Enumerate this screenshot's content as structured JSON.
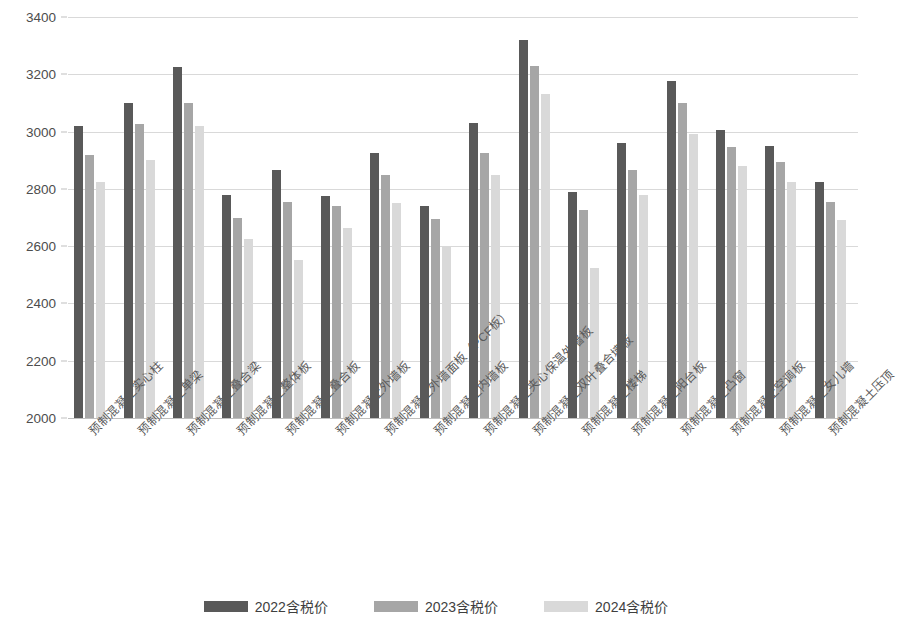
{
  "chart_data": {
    "type": "bar",
    "title": "",
    "subtitle": "",
    "xlabel": "",
    "ylabel": "",
    "ylim": [
      2000,
      3400
    ],
    "ytick_step": 200,
    "yticks": [
      "2000",
      "2200",
      "2400",
      "2600",
      "2800",
      "3000",
      "3200",
      "3400"
    ],
    "grid": true,
    "legend_position": "bottom",
    "categories": [
      "预制混凝土实心柱",
      "预制混凝土单梁",
      "预制混凝土叠合梁",
      "预制混凝土整体板",
      "预制混凝土叠合板",
      "预制混凝土外墙板",
      "预制混凝土外墙面板（PCF板）",
      "预制混凝土内墙板",
      "预制混凝土夹心保温外墙板",
      "预制混凝土双叶叠合墙板",
      "预制混凝土楼梯",
      "预制混凝土阳台板",
      "预制混凝土凸窗",
      "预制混凝土空调板",
      "预制混凝土女儿墙",
      "预制混凝土压顶"
    ],
    "series": [
      {
        "name": "2022含税价",
        "color": "#595959",
        "values": [
          3020,
          3100,
          3225,
          2780,
          2865,
          2775,
          2925,
          2740,
          3030,
          3320,
          2790,
          2960,
          3175,
          3005,
          2950,
          2825
        ]
      },
      {
        "name": "2023含税价",
        "color": "#a6a6a6",
        "values": [
          2920,
          3025,
          3100,
          2700,
          2755,
          2740,
          2850,
          2695,
          2925,
          3230,
          2725,
          2865,
          3100,
          2945,
          2895,
          2755
        ]
      },
      {
        "name": "2024含税价",
        "color": "#d9d9d9",
        "values": [
          2825,
          2900,
          3020,
          2625,
          2550,
          2665,
          2750,
          2600,
          2850,
          3130,
          2525,
          2780,
          2990,
          2880,
          2825,
          2690
        ]
      }
    ]
  }
}
